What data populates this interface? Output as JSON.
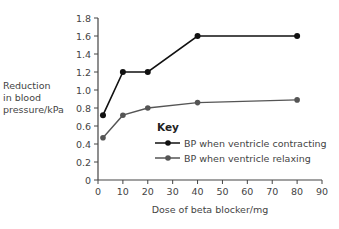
{
  "chart_data": {
    "type": "line",
    "title": "",
    "xlabel": "Dose of beta blocker/mg",
    "ylabel": [
      "Reduction",
      "in blood",
      "pressure/kPa"
    ],
    "xlim": [
      0,
      90
    ],
    "ylim": [
      0,
      1.8
    ],
    "xticks": [
      0,
      10,
      20,
      30,
      40,
      50,
      60,
      70,
      80,
      90
    ],
    "yticks": [
      "0",
      "0.2",
      "0.4",
      "0.6",
      "0.8",
      "1.0",
      "1.2",
      "1.4",
      "1.6",
      "1.8"
    ],
    "grid": false,
    "legend": {
      "title": "Key",
      "position": "inside-center-right",
      "entries": [
        "BP when ventricle contracting",
        "BP when ventricle relaxing"
      ]
    },
    "series": [
      {
        "name": "BP when ventricle contracting",
        "color": "#111111",
        "x": [
          2,
          10,
          20,
          40,
          80
        ],
        "y": [
          0.72,
          1.2,
          1.2,
          1.6,
          1.6
        ]
      },
      {
        "name": "BP when ventricle relaxing",
        "color": "#555555",
        "x": [
          2,
          10,
          20,
          40,
          80
        ],
        "y": [
          0.47,
          0.72,
          0.8,
          0.86,
          0.89
        ]
      }
    ]
  }
}
